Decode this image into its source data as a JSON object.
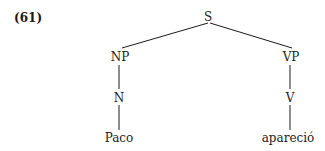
{
  "example_number": "(61)",
  "tree": {
    "root": "S",
    "np": "NP",
    "vp": "VP",
    "n": "N",
    "v": "V",
    "noun_word": "Paco",
    "verb_word": "apareció"
  },
  "colors": {
    "ink": "#1a1a1a",
    "background": "#ffffff"
  }
}
